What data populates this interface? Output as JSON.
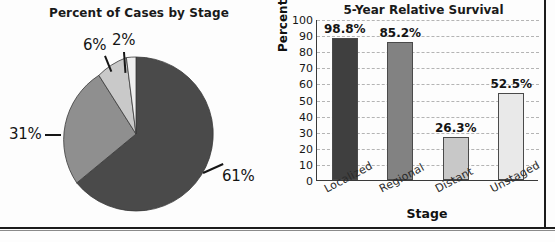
{
  "figure": {
    "panels": [
      "pie",
      "bar"
    ]
  },
  "chart_data": [
    {
      "type": "pie",
      "title": "Percent of Cases by Stage",
      "categories": [
        "Localized",
        "Regional",
        "Unstaged",
        "Distant"
      ],
      "values": [
        61,
        31,
        6,
        2
      ],
      "labels": [
        "61%",
        "31%",
        "6%",
        "2%"
      ],
      "colors": [
        "#4a4a4a",
        "#8f8f8f",
        "#c9c9c9",
        "#efefef"
      ],
      "start_angle": 0,
      "direction": "clockwise",
      "legend": "none",
      "xlabel": "",
      "ylabel": ""
    },
    {
      "type": "bar",
      "title": "5-Year Relative Survival",
      "categories": [
        "Localized",
        "Regional",
        "Distant",
        "Unstaged"
      ],
      "values": [
        98.8,
        85.2,
        26.3,
        52.5
      ],
      "plotted_heights": [
        88,
        86,
        27,
        54
      ],
      "labels": [
        "98.8%",
        "85.2%",
        "26.3%",
        "52.5%"
      ],
      "colors": [
        "#3f3f3f",
        "#828282",
        "#c8c8c8",
        "#e9e9e9"
      ],
      "xlabel": "Stage",
      "ylabel": "Percent",
      "ylim": [
        0,
        100
      ],
      "yticks": [
        100,
        90,
        80,
        70,
        60,
        50,
        40,
        30,
        20,
        10,
        0
      ],
      "grid": true,
      "grid_style": "dashed",
      "legend": "none"
    }
  ]
}
